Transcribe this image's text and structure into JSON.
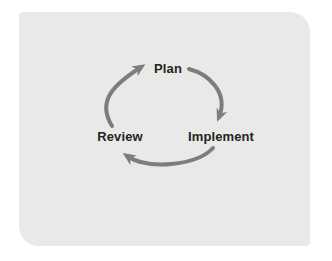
{
  "diagram": {
    "type": "cycle",
    "nodes": [
      {
        "id": "plan",
        "label": "Plan"
      },
      {
        "id": "implement",
        "label": "Implement"
      },
      {
        "id": "review",
        "label": "Review"
      }
    ],
    "arrows": [
      {
        "from": "plan",
        "to": "implement"
      },
      {
        "from": "implement",
        "to": "review"
      },
      {
        "from": "review",
        "to": "plan"
      }
    ],
    "direction": "clockwise",
    "colors": {
      "page_background": "#ffffff",
      "card_background": "#e9e9e7",
      "arrow": "#7d7d7b",
      "label_text": "#242424"
    }
  }
}
